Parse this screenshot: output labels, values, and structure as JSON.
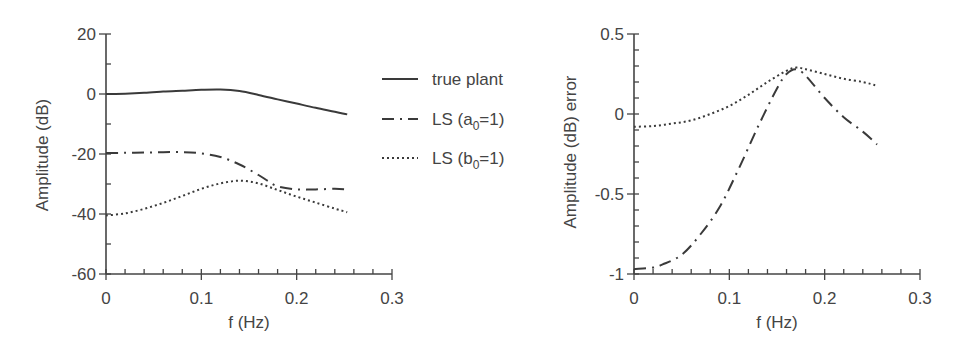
{
  "chart_data": [
    {
      "type": "line",
      "title": "",
      "xlabel": "f (Hz)",
      "ylabel": "Amplitude (dB)",
      "xlim": [
        0,
        0.3
      ],
      "ylim": [
        -60,
        20
      ],
      "grid": false,
      "x_ticks": [
        "0",
        "0.1",
        "0.2",
        "0.3"
      ],
      "y_ticks": [
        "20",
        "0",
        "-20",
        "-40",
        "-60"
      ],
      "legend_position": "right-outside",
      "series": [
        {
          "name": "true plant",
          "style": "solid",
          "x": [
            0,
            0.02,
            0.04,
            0.06,
            0.08,
            0.1,
            0.12,
            0.14,
            0.16,
            0.18,
            0.2,
            0.22,
            0.24,
            0.253
          ],
          "values": [
            0,
            0.1,
            0.4,
            0.8,
            1.1,
            1.4,
            1.5,
            1.0,
            -0.3,
            -1.8,
            -3.2,
            -4.6,
            -5.9,
            -6.8
          ]
        },
        {
          "name": "LS (a0=1)",
          "style": "dash-dot",
          "x": [
            0,
            0.02,
            0.04,
            0.06,
            0.08,
            0.1,
            0.12,
            0.14,
            0.16,
            0.17,
            0.18,
            0.2,
            0.22,
            0.24,
            0.253
          ],
          "values": [
            -19.7,
            -19.6,
            -19.5,
            -19.4,
            -19.4,
            -19.8,
            -21.0,
            -23.5,
            -27.0,
            -29.0,
            -30.8,
            -31.8,
            -31.8,
            -31.6,
            -31.8
          ]
        },
        {
          "name": "LS (b0=1)",
          "style": "dotted",
          "x": [
            0,
            0.02,
            0.04,
            0.06,
            0.08,
            0.1,
            0.12,
            0.14,
            0.16,
            0.18,
            0.2,
            0.22,
            0.24,
            0.253
          ],
          "values": [
            -40.5,
            -39.8,
            -38.3,
            -36.3,
            -34.0,
            -31.6,
            -29.8,
            -28.9,
            -29.8,
            -32.0,
            -34.2,
            -36.2,
            -38.2,
            -39.4
          ]
        }
      ]
    },
    {
      "type": "line",
      "title": "",
      "xlabel": "f (Hz)",
      "ylabel": "Amplitude (dB) error",
      "xlim": [
        0,
        0.3
      ],
      "ylim": [
        -1,
        0.5
      ],
      "grid": false,
      "x_ticks": [
        "0",
        "0.1",
        "0.2",
        "0.3"
      ],
      "y_ticks": [
        "0.5",
        "0",
        "-0.5",
        "-1"
      ],
      "series": [
        {
          "name": "LS (a0=1)",
          "style": "dash-dot",
          "x": [
            0,
            0.02,
            0.03,
            0.05,
            0.07,
            0.09,
            0.11,
            0.13,
            0.15,
            0.16,
            0.17,
            0.18,
            0.2,
            0.22,
            0.24,
            0.255
          ],
          "values": [
            -0.97,
            -0.96,
            -0.94,
            -0.88,
            -0.75,
            -0.58,
            -0.34,
            -0.08,
            0.16,
            0.25,
            0.28,
            0.24,
            0.1,
            -0.02,
            -0.11,
            -0.19
          ]
        },
        {
          "name": "LS (b0=1)",
          "style": "dotted",
          "x": [
            0,
            0.02,
            0.04,
            0.06,
            0.08,
            0.1,
            0.12,
            0.14,
            0.16,
            0.17,
            0.18,
            0.2,
            0.22,
            0.24,
            0.253
          ],
          "values": [
            -0.08,
            -0.075,
            -0.06,
            -0.04,
            0.0,
            0.05,
            0.12,
            0.2,
            0.27,
            0.29,
            0.28,
            0.25,
            0.22,
            0.2,
            0.18
          ]
        }
      ]
    }
  ],
  "legend": {
    "items": [
      {
        "label": "true plant",
        "style": "solid"
      },
      {
        "label_main": "LS (a",
        "label_sub": "0",
        "label_tail": "=1)",
        "style": "dash-dot"
      },
      {
        "label_main": "LS (b",
        "label_sub": "0",
        "label_tail": "=1)",
        "style": "dotted"
      }
    ]
  },
  "colors": {
    "line": "#3a3a3a",
    "axis": "#444444",
    "background": "#ffffff"
  }
}
